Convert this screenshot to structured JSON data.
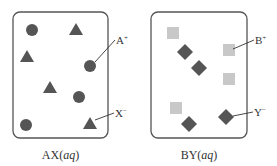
{
  "colors": {
    "box_stroke": "#555555",
    "dark_shape": "#555555",
    "light_shape": "#c8c8c8",
    "text": "#333333"
  },
  "panels": [
    {
      "caption": {
        "base": "AX(",
        "italic": "aq",
        "close": ")"
      },
      "box": {
        "x": 13,
        "y": 12,
        "w": 95,
        "h": 126
      },
      "shapes": [
        {
          "type": "circle",
          "cx": 32,
          "cy": 30
        },
        {
          "type": "triangle",
          "cx": 76,
          "cy": 30
        },
        {
          "type": "triangle",
          "cx": 27,
          "cy": 57
        },
        {
          "type": "circle",
          "cx": 90,
          "cy": 66
        },
        {
          "type": "triangle",
          "cx": 50,
          "cy": 88
        },
        {
          "type": "circle",
          "cx": 79,
          "cy": 97
        },
        {
          "type": "circle",
          "cx": 26,
          "cy": 125
        },
        {
          "type": "triangle",
          "cx": 90,
          "cy": 124
        }
      ],
      "callouts": [
        {
          "ion": "A",
          "charge": "+",
          "from": [
            95,
            62
          ],
          "to": [
            115,
            40
          ],
          "tx": 116,
          "ty": 44
        },
        {
          "ion": "X",
          "charge": "−",
          "from": [
            95,
            120
          ],
          "to": [
            114,
            113
          ],
          "tx": 115,
          "ty": 117
        }
      ]
    },
    {
      "caption": {
        "base": "BY(",
        "italic": "aq",
        "close": ")"
      },
      "box": {
        "x": 151,
        "y": 12,
        "w": 96,
        "h": 126
      },
      "shapes": [
        {
          "type": "square",
          "cx": 173,
          "cy": 33
        },
        {
          "type": "diamond",
          "cx": 185,
          "cy": 52
        },
        {
          "type": "diamond",
          "cx": 199,
          "cy": 68
        },
        {
          "type": "square",
          "cx": 229,
          "cy": 50
        },
        {
          "type": "square",
          "cx": 229,
          "cy": 79
        },
        {
          "type": "square",
          "cx": 176,
          "cy": 108
        },
        {
          "type": "diamond",
          "cx": 189,
          "cy": 124
        },
        {
          "type": "diamond",
          "cx": 226,
          "cy": 117
        }
      ],
      "callouts": [
        {
          "ion": "B",
          "charge": "+",
          "from": [
            233,
            49
          ],
          "to": [
            254,
            40
          ],
          "tx": 255,
          "ty": 44
        },
        {
          "ion": "Y",
          "charge": "−",
          "from": [
            233,
            116
          ],
          "to": [
            253,
            112
          ],
          "tx": 254,
          "ty": 116
        }
      ]
    }
  ]
}
